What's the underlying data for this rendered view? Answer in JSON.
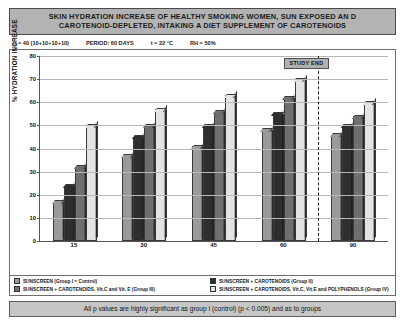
{
  "title": {
    "line1": "SKIN HYDRATION INCREASE OF HEALTHY SMOKING WOMEN, SUN EXPOSED AN D",
    "line2": "CAROTENOID-DEPLETED, INTAKING A DIET SUPPLEMENT OF CAROTENOIDS"
  },
  "params": {
    "n": "n = 40 (10+10+10+10)",
    "period": "PERIOD: 60 DAYS",
    "temperature": "t = 22 °C",
    "humidity": "RH = 50%"
  },
  "annotation": {
    "study_end": "STUDY END"
  },
  "legend": {
    "items": [
      {
        "label": "SUNSCREEN (Group I = Control)",
        "color": "#9a9a9a"
      },
      {
        "label": "SUNSCREEN + CAROTENOIDS (Group II)",
        "color": "#2e2e2e"
      },
      {
        "label": "SUNSCREEN + CAROTENOIDS, Vit.C and Vit. E (Group III)",
        "color": "#6f6f6f"
      },
      {
        "label": "SUNSCREEN + CAROTENOIDS, Vit.C, Vit.E and POLYPHENOLS (Group IV)",
        "color": "#e3e3e3"
      }
    ]
  },
  "footer": {
    "text": "All p values are highly significant as group I (control) (p < 0.005) and as to groups"
  },
  "chart_data": {
    "type": "bar",
    "title": "SKIN HYDRATION INCREASE OF HEALTHY SMOKING WOMEN, SUN EXPOSED AN D CAROTENOID-DEPLETED, INTAKING A DIET SUPPLEMENT OF CAROTENOIDS",
    "xlabel": "",
    "ylabel": "% HYDRATION INCREASE",
    "categories": [
      "15",
      "30",
      "45",
      "60",
      "90"
    ],
    "ylim": [
      0,
      80
    ],
    "yticks": [
      0,
      10,
      20,
      30,
      40,
      50,
      60,
      70,
      80
    ],
    "grid": true,
    "legend_position": "bottom",
    "series": [
      {
        "name": "SUNSCREEN (Group I = Control)",
        "color": "#9a9a9a",
        "values": [
          17,
          37,
          41,
          48,
          46
        ]
      },
      {
        "name": "SUNSCREEN + CAROTENOIDS (Group II)",
        "color": "#2e2e2e",
        "values": [
          24,
          45,
          50,
          55,
          50
        ]
      },
      {
        "name": "SUNSCREEN + CAROTENOIDS, Vit.C and Vit. E (Group III)",
        "color": "#6f6f6f",
        "values": [
          32,
          50,
          56,
          62,
          54
        ]
      },
      {
        "name": "SUNSCREEN + CAROTENOIDS, Vit.C, Vit.E and POLYPHENOLS (Group IV)",
        "color": "#e3e3e3",
        "values": [
          50,
          57,
          63,
          70,
          60
        ]
      }
    ],
    "annotations": [
      {
        "text": "STUDY END",
        "type": "vertical-dashed-line",
        "between_categories": [
          "60",
          "90"
        ]
      }
    ]
  }
}
